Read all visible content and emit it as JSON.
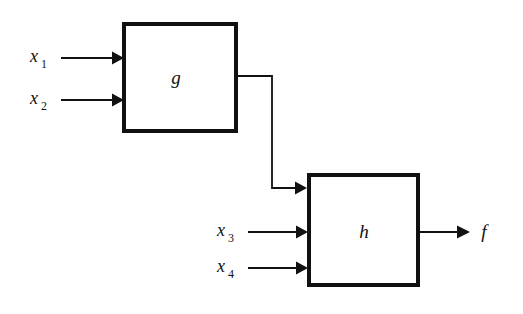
{
  "diagram": {
    "background_color": "#ffffff",
    "line_color": "#111111",
    "blocks": [
      {
        "id": "g",
        "label": "g",
        "x": 122,
        "y": 22,
        "width": 116,
        "height": 111
      },
      {
        "id": "h",
        "label": "h",
        "x": 307,
        "y": 173,
        "width": 113,
        "height": 114
      }
    ],
    "inputs": [
      {
        "id": "x1",
        "base": "x",
        "subscript": "1",
        "target_block": "g",
        "arrow_y": 58
      },
      {
        "id": "x2",
        "base": "x",
        "subscript": "2",
        "target_block": "g",
        "arrow_y": 100
      },
      {
        "id": "x3",
        "base": "x",
        "subscript": "3",
        "target_block": "h",
        "arrow_y": 232
      },
      {
        "id": "x4",
        "base": "x",
        "subscript": "4",
        "target_block": "h",
        "arrow_y": 268
      }
    ],
    "outputs": [
      {
        "id": "f",
        "label": "f",
        "source_block": "h",
        "arrow_y": 232
      }
    ],
    "connector": {
      "from_block": "g",
      "to_block": "h",
      "from_y": 76,
      "corner_x": 272,
      "to_y": 188
    }
  }
}
